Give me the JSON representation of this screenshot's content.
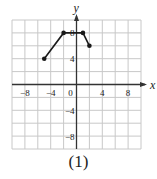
{
  "chart_data": {
    "type": "line",
    "title": "",
    "xlabel": "x",
    "ylabel": "y",
    "xlim": [
      -10,
      10
    ],
    "ylim": [
      -10,
      10
    ],
    "grid": true,
    "grid_step": 2,
    "x_ticks": [
      -8,
      -4,
      0,
      4,
      8
    ],
    "y_ticks": [
      8,
      4,
      -4,
      -8
    ],
    "x_tick_labels": [
      "−8",
      "−4",
      "0",
      "4",
      "8"
    ],
    "y_tick_labels": [
      "8",
      "4",
      "−4",
      "−8"
    ],
    "series": [
      {
        "name": "piecewise",
        "points": [
          [
            -5,
            4
          ],
          [
            -2,
            8
          ],
          [
            1,
            8
          ],
          [
            2,
            6
          ]
        ],
        "markers": true
      }
    ],
    "legend": null
  },
  "caption": "(1)",
  "colors": {
    "grid": "#c8c8c8",
    "axis": "#333333",
    "line": "#1a1a1a",
    "text": "#222222"
  }
}
